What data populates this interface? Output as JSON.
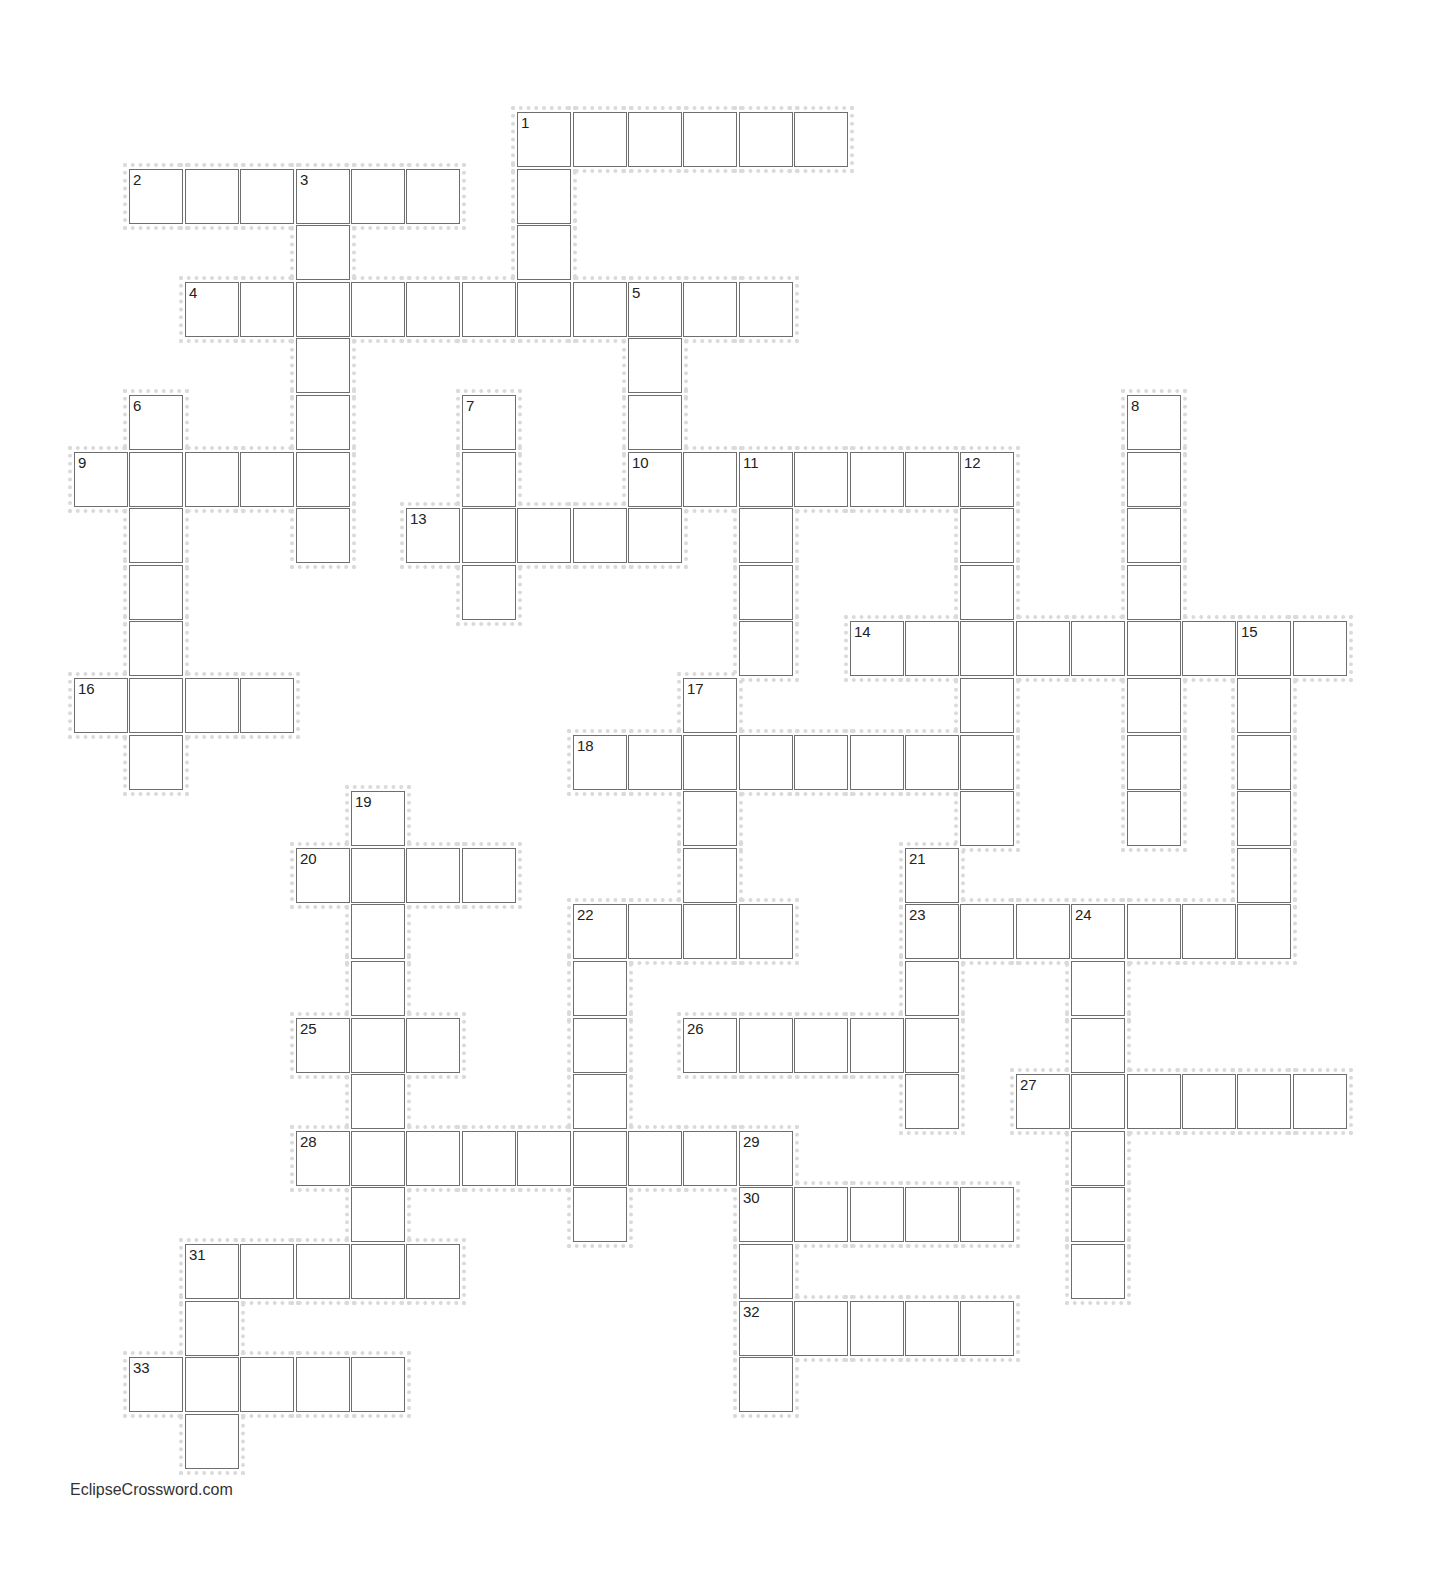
{
  "puzzle": {
    "grid": {
      "origin_x": 74,
      "origin_y": 112,
      "pitch_x": 55.4,
      "pitch_y": 56.6,
      "cell_w": 54,
      "cell_h": 55
    },
    "border_color": "#6e6e6e",
    "halo_color": "#dadada",
    "words": [
      {
        "number": "1",
        "direction": "across",
        "row": 0,
        "col": 8,
        "length": 6
      },
      {
        "number": "1",
        "direction": "down",
        "row": 0,
        "col": 8,
        "length": 4
      },
      {
        "number": "2",
        "direction": "across",
        "row": 1,
        "col": 1,
        "length": 6
      },
      {
        "number": "3",
        "direction": "down",
        "row": 1,
        "col": 4,
        "length": 7
      },
      {
        "number": "4",
        "direction": "across",
        "row": 3,
        "col": 2,
        "length": 11
      },
      {
        "number": "5",
        "direction": "down",
        "row": 3,
        "col": 10,
        "length": 5
      },
      {
        "number": "6",
        "direction": "down",
        "row": 5,
        "col": 1,
        "length": 7
      },
      {
        "number": "7",
        "direction": "down",
        "row": 5,
        "col": 7,
        "length": 4
      },
      {
        "number": "8",
        "direction": "down",
        "row": 5,
        "col": 19,
        "length": 8
      },
      {
        "number": "9",
        "direction": "across",
        "row": 6,
        "col": 0,
        "length": 5
      },
      {
        "number": "10",
        "direction": "across",
        "row": 6,
        "col": 10,
        "length": 7
      },
      {
        "number": "11",
        "direction": "down",
        "row": 6,
        "col": 12,
        "length": 4
      },
      {
        "number": "12",
        "direction": "down",
        "row": 6,
        "col": 16,
        "length": 7
      },
      {
        "number": "13",
        "direction": "across",
        "row": 7,
        "col": 6,
        "length": 5
      },
      {
        "number": "14",
        "direction": "across",
        "row": 9,
        "col": 14,
        "length": 9
      },
      {
        "number": "15",
        "direction": "down",
        "row": 9,
        "col": 21,
        "length": 6
      },
      {
        "number": "16",
        "direction": "across",
        "row": 10,
        "col": 0,
        "length": 4
      },
      {
        "number": "17",
        "direction": "down",
        "row": 10,
        "col": 11,
        "length": 5
      },
      {
        "number": "18",
        "direction": "across",
        "row": 11,
        "col": 9,
        "length": 8
      },
      {
        "number": "19",
        "direction": "down",
        "row": 12,
        "col": 5,
        "length": 9
      },
      {
        "number": "20",
        "direction": "across",
        "row": 13,
        "col": 4,
        "length": 4
      },
      {
        "number": "21",
        "direction": "down",
        "row": 13,
        "col": 15,
        "length": 5
      },
      {
        "number": "22",
        "direction": "across",
        "row": 14,
        "col": 9,
        "length": 4
      },
      {
        "number": "22",
        "direction": "down",
        "row": 14,
        "col": 9,
        "length": 6
      },
      {
        "number": "23",
        "direction": "across",
        "row": 14,
        "col": 15,
        "length": 7
      },
      {
        "number": "24",
        "direction": "down",
        "row": 14,
        "col": 18,
        "length": 7
      },
      {
        "number": "25",
        "direction": "across",
        "row": 16,
        "col": 4,
        "length": 3
      },
      {
        "number": "26",
        "direction": "across",
        "row": 16,
        "col": 11,
        "length": 5
      },
      {
        "number": "27",
        "direction": "across",
        "row": 17,
        "col": 17,
        "length": 6
      },
      {
        "number": "28",
        "direction": "across",
        "row": 18,
        "col": 4,
        "length": 9
      },
      {
        "number": "29",
        "direction": "down",
        "row": 18,
        "col": 12,
        "length": 5
      },
      {
        "number": "30",
        "direction": "across",
        "row": 19,
        "col": 12,
        "length": 5
      },
      {
        "number": "31",
        "direction": "across",
        "row": 20,
        "col": 2,
        "length": 5
      },
      {
        "number": "31",
        "direction": "down",
        "row": 20,
        "col": 2,
        "length": 4
      },
      {
        "number": "32",
        "direction": "across",
        "row": 21,
        "col": 12,
        "length": 5
      },
      {
        "number": "33",
        "direction": "across",
        "row": 22,
        "col": 1,
        "length": 5
      }
    ]
  },
  "footer": {
    "credit": "EclipseCrossword.com"
  }
}
